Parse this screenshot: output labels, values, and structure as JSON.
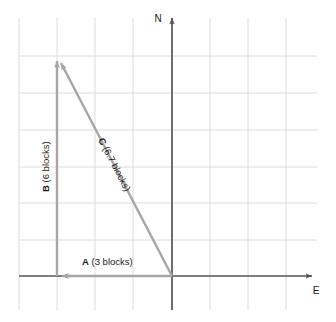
{
  "diagram": {
    "type": "vector-diagram",
    "title": "",
    "background_color": "#ffffff",
    "grid": {
      "visible": true,
      "color": "#d8d8d8",
      "spacing_px": 38,
      "vertical_lines_x": [
        19,
        57,
        95,
        133,
        172,
        210,
        248,
        286
      ],
      "horizontal_lines_y": [
        56,
        93,
        130,
        167,
        203,
        240
      ],
      "x_extent": [
        19,
        317
      ],
      "y_extent": [
        18,
        310
      ]
    },
    "axes": {
      "color": "#555555",
      "origin": {
        "x": 172,
        "y": 276
      },
      "north": {
        "label": "N",
        "label_x": 158,
        "label_y": 22,
        "tip_x": 172,
        "tip_y": 14,
        "base_y": 310
      },
      "east": {
        "label": "E",
        "label_x": 316,
        "label_y": 293,
        "tip_x": 318,
        "tip_y": 276,
        "base_x": 19
      }
    },
    "vectors": [
      {
        "id": "A",
        "name": "vector-a",
        "label_bold": "A",
        "label_rest": " (3 blocks)",
        "label_text": "A (3 blocks)",
        "magnitude": 3,
        "units": "blocks",
        "direction": "west",
        "color": "#a6a6a6",
        "start": {
          "x": 172,
          "y": 276
        },
        "end": {
          "x": 57,
          "y": 276
        },
        "label_x": 82,
        "label_y": 265,
        "rotation_deg": 0
      },
      {
        "id": "B",
        "name": "vector-b",
        "label_bold": "B",
        "label_rest": " (6 blocks)",
        "label_text": "B (6 blocks)",
        "magnitude": 6,
        "units": "blocks",
        "direction": "north",
        "color": "#a6a6a6",
        "start": {
          "x": 57,
          "y": 276
        },
        "end": {
          "x": 57,
          "y": 56
        },
        "label_x": 49,
        "label_y": 192,
        "rotation_deg": -90
      },
      {
        "id": "C",
        "name": "vector-c",
        "label_bold": "C",
        "label_rest": " (6.7 blocks)",
        "label_text": "C (6.7 blocks)",
        "magnitude": 6.7,
        "units": "blocks",
        "direction": "northwest",
        "color": "#a6a6a6",
        "start": {
          "x": 172,
          "y": 276
        },
        "end": {
          "x": 57,
          "y": 56
        },
        "label_x": 98,
        "label_y": 140,
        "rotation_deg": 62.4
      }
    ]
  }
}
